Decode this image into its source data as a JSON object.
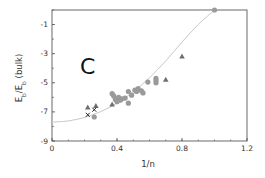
{
  "chart_data": {
    "type": "scatter",
    "title": "",
    "panel_label": "C",
    "xlabel": "1/n",
    "ylabel": "E_b/E_b (bulk)",
    "ylabel_parts": {
      "main": "E",
      "sub": "b",
      "sep": "/E",
      "sub2": "b",
      "suffix": " (bulk)"
    },
    "xlim": [
      0,
      1.2
    ],
    "ylim": [
      -9,
      0
    ],
    "x_ticks": [
      0,
      0.4,
      0.8,
      1.2
    ],
    "x_tick_labels": [
      "0",
      "0.4",
      "0.8",
      "1.2"
    ],
    "y_ticks": [
      -9,
      -7,
      -5,
      -3,
      -1
    ],
    "y_tick_labels": [
      "-9",
      "-7",
      "-5",
      "-3",
      "-1"
    ],
    "grid": false,
    "legend": null,
    "series": [
      {
        "name": "circles",
        "marker": "circle",
        "color": "#9a9a9a",
        "points": [
          [
            1.0,
            0.0
          ],
          [
            0.64,
            -4.7
          ],
          [
            0.64,
            -4.85
          ],
          [
            0.64,
            -5.0
          ],
          [
            0.59,
            -4.95
          ],
          [
            0.56,
            -5.7
          ],
          [
            0.55,
            -5.55
          ],
          [
            0.53,
            -5.4
          ],
          [
            0.52,
            -5.6
          ],
          [
            0.51,
            -5.5
          ],
          [
            0.49,
            -5.85
          ],
          [
            0.47,
            -5.6
          ],
          [
            0.47,
            -6.4
          ],
          [
            0.45,
            -6.05
          ],
          [
            0.43,
            -6.1
          ],
          [
            0.42,
            -6.2
          ],
          [
            0.41,
            -6.0
          ],
          [
            0.4,
            -6.3
          ],
          [
            0.39,
            -6.15
          ],
          [
            0.38,
            -5.9
          ],
          [
            0.37,
            -5.75
          ],
          [
            0.26,
            -7.35
          ]
        ]
      },
      {
        "name": "triangles",
        "marker": "triangle",
        "color": "#6e6e6e",
        "points": [
          [
            0.8,
            -3.2
          ],
          [
            0.7,
            -4.8
          ],
          [
            0.37,
            -6.5
          ],
          [
            0.27,
            -6.6
          ],
          [
            0.22,
            -6.7
          ]
        ]
      },
      {
        "name": "crosses",
        "marker": "x",
        "color": "#222222",
        "points": [
          [
            0.22,
            -7.2
          ],
          [
            0.26,
            -6.85
          ]
        ]
      }
    ],
    "fit_curve": {
      "color": "#c8c8c8",
      "description": "smooth guide curve",
      "points": [
        [
          0.0,
          -7.7
        ],
        [
          0.1,
          -7.62
        ],
        [
          0.2,
          -7.38
        ],
        [
          0.3,
          -6.98
        ],
        [
          0.4,
          -6.4
        ],
        [
          0.5,
          -5.62
        ],
        [
          0.6,
          -4.65
        ],
        [
          0.7,
          -3.5
        ],
        [
          0.8,
          -2.2
        ],
        [
          0.9,
          -1.0
        ],
        [
          1.0,
          0.0
        ]
      ]
    }
  },
  "style": {
    "axis_color": "#444444",
    "tick_color": "#444444"
  }
}
